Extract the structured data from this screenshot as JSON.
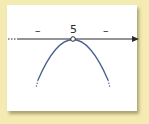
{
  "diagram": {
    "type": "sign-chart",
    "axis": {
      "direction": "right",
      "critical_point_label": "5",
      "critical_point_marker": "open-circle"
    },
    "signs": {
      "left": "–",
      "right": "–"
    },
    "curve": {
      "shape": "downward-opening parabola",
      "vertex_at": "5",
      "ends": "dotted"
    },
    "colors": {
      "background": "#f4ebb2",
      "card": "#ffffff",
      "axis": "#2b2b2b",
      "curve": "#4a5f8f"
    }
  }
}
